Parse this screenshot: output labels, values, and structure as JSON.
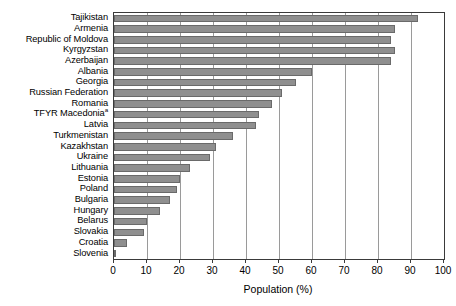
{
  "chart_data": {
    "type": "bar",
    "orientation": "horizontal",
    "title": "",
    "xlabel": "Population (%)",
    "ylabel": "",
    "xlim": [
      0,
      100
    ],
    "xticks": [
      0,
      10,
      20,
      30,
      40,
      50,
      60,
      70,
      80,
      90,
      100
    ],
    "grid": true,
    "legend": false,
    "bar_color": "#8f8f8f",
    "bar_edge_color": "#6a6a6a",
    "categories": [
      "Tajikistan",
      "Armenia",
      "Republic of Moldova",
      "Kyrgyzstan",
      "Azerbaijan",
      "Albania",
      "Georgia",
      "Russian Federation",
      "Romania",
      "TFYR Macedonia",
      "Latvia",
      "Turkmenistan",
      "Kazakhstan",
      "Ukraine",
      "Lithuania",
      "Estonia",
      "Poland",
      "Bulgaria",
      "Hungary",
      "Belarus",
      "Slovakia",
      "Croatia",
      "Slovenia"
    ],
    "category_footnotes": {
      "TFYR Macedonia": "a"
    },
    "values": [
      92,
      85,
      84,
      85,
      84,
      60,
      55,
      51,
      48,
      44,
      43,
      36,
      31,
      29,
      23,
      20,
      19,
      17,
      14,
      10,
      9,
      4,
      0.6
    ]
  },
  "axis": {
    "x_title": "Population (%)",
    "x_tick_labels": [
      "0",
      "10",
      "20",
      "30",
      "40",
      "50",
      "60",
      "70",
      "80",
      "90",
      "100"
    ]
  }
}
